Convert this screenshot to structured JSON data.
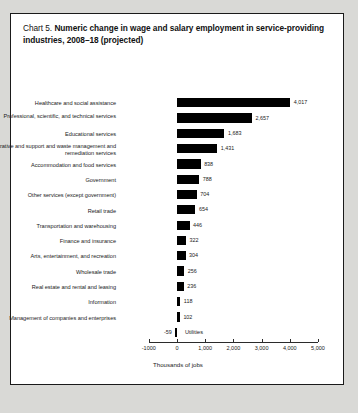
{
  "title": {
    "prefix": "Chart 5.",
    "main": "Numeric change in wage and salary employment in service-providing industries, 2008–18 (projected)"
  },
  "chart_data": {
    "type": "bar",
    "orientation": "horizontal",
    "title": "Chart 5. Numeric change in wage and salary employment in service-providing industries, 2008–18 (projected)",
    "xlabel": "Thousands of jobs",
    "ylabel": "",
    "xlim": [
      -1000,
      5000
    ],
    "grid": false,
    "legend": null,
    "tick_labels": [
      "-1000",
      "0",
      "1,000",
      "2,000",
      "3,000",
      "4,000",
      "5,000"
    ],
    "tick_values": [
      -1000,
      0,
      1000,
      2000,
      3000,
      4000,
      5000
    ],
    "categories": [
      "Healthcare and social assistance",
      "Professional, scientific, and technical services",
      "Educational services",
      "Administrative and support and waste management and remediation services",
      "Accommodation and food services",
      "Government",
      "Other services (except government)",
      "Retail trade",
      "Transportation and warehousing",
      "Finance and insurance",
      "Arts, entertainment, and recreation",
      "Wholesale trade",
      "Real estate and rental and leasing",
      "Information",
      "Management of companies and enterprises",
      "Utilities"
    ],
    "values": [
      4017,
      2657,
      1683,
      1431,
      838,
      788,
      704,
      654,
      446,
      322,
      304,
      256,
      236,
      118,
      102,
      -59
    ],
    "value_labels": [
      "4,017",
      "2,657",
      "1,683",
      "1,431",
      "838",
      "788",
      "704",
      "654",
      "446",
      "322",
      "304",
      "256",
      "236",
      "118",
      "102",
      "-59"
    ],
    "bar_color": "#000000"
  }
}
